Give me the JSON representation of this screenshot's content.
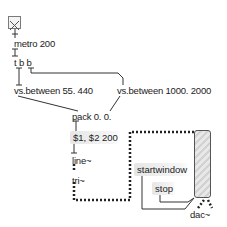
{
  "patcher": {
    "toggle": {
      "state": "checked"
    },
    "objects": {
      "metro": "metro 200",
      "trigger": "t b b",
      "between1": "vs.between 55. 440",
      "between2": "vs.between 1000. 2000",
      "pack": "pack 0. 0.",
      "line": "line~",
      "tri": "tri~",
      "dac": "dac~"
    },
    "messages": {
      "ramp": "$1, $2 200",
      "startwindow": "startwindow",
      "stop": "stop"
    },
    "colors": {
      "background": "#ffffff",
      "patchcord": "#333333",
      "signal_cord": "#222222",
      "message_bg": "#e6e6e6"
    }
  }
}
